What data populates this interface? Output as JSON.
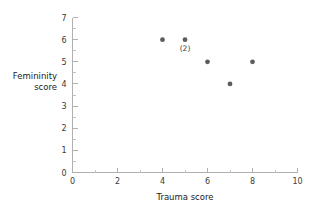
{
  "chart_data": {
    "type": "scatter",
    "title": "",
    "xlabel": "Trauma score",
    "ylabel_lines": [
      "Femininity",
      "score"
    ],
    "ylabel": "Femininity score",
    "xlim": [
      0,
      10
    ],
    "ylim": [
      0,
      7
    ],
    "x_ticks": [
      0,
      2,
      4,
      6,
      8,
      10
    ],
    "x_tick_labels": [
      "0",
      "2",
      "4",
      "6",
      "8",
      "10"
    ],
    "x_minor_ticks": [
      1,
      3,
      5,
      7,
      9
    ],
    "y_ticks": [
      0,
      1,
      2,
      3,
      4,
      5,
      6,
      7
    ],
    "y_tick_labels": [
      "0",
      "1",
      "2",
      "3",
      "4",
      "5",
      "6",
      "7"
    ],
    "y_minor_ticks": [
      0.5,
      1.5,
      2.5,
      3.5,
      4.5,
      5.5,
      6.5
    ],
    "grid": false,
    "legend": null,
    "marker_color": "#5c5c5c",
    "axis_color": "#b0b0b0",
    "points": [
      {
        "x": 4,
        "y": 6,
        "label": ""
      },
      {
        "x": 5,
        "y": 6,
        "label": "(2)"
      },
      {
        "x": 6,
        "y": 5,
        "label": ""
      },
      {
        "x": 7,
        "y": 4,
        "label": ""
      },
      {
        "x": 8,
        "y": 5,
        "label": ""
      }
    ]
  }
}
